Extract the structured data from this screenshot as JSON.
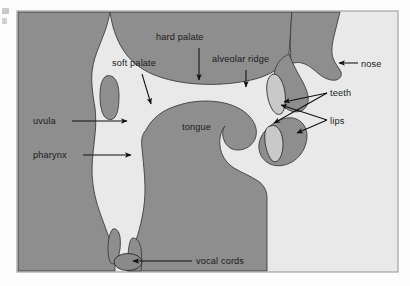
{
  "figure": {
    "kind": "anatomical-diagram",
    "frame": {
      "x": 17,
      "y": 11,
      "width": 381,
      "height": 261
    },
    "colors": {
      "page_background": "#fdfdfd",
      "panel_background": "#e9e9e9",
      "tissue_fill": "#8e8e8e",
      "tissue_outline": "#3d3d3d",
      "teeth_fill": "#c9c9c9",
      "cavity_fill": "#e9e9e9",
      "label_text": "#1a1a1a",
      "leader_line": "#111111",
      "frame_border": "#9a9a9a"
    }
  },
  "labels": [
    {
      "id": "hard-palate",
      "text": "hard palate",
      "x": 156,
      "y": 40,
      "anchor": "start"
    },
    {
      "id": "soft-palate",
      "text": "soft palate",
      "x": 112,
      "y": 66,
      "anchor": "start"
    },
    {
      "id": "alveolar-ridge",
      "text": "alveolar ridge",
      "x": 212,
      "y": 62,
      "anchor": "start"
    },
    {
      "id": "nose",
      "text": "nose",
      "x": 361,
      "y": 67,
      "anchor": "start"
    },
    {
      "id": "teeth",
      "text": "teeth",
      "x": 330,
      "y": 96,
      "anchor": "start"
    },
    {
      "id": "lips",
      "text": "lips",
      "x": 330,
      "y": 124,
      "anchor": "start"
    },
    {
      "id": "uvula",
      "text": "uvula",
      "x": 33,
      "y": 124,
      "anchor": "start"
    },
    {
      "id": "pharynx",
      "text": "pharynx",
      "x": 33,
      "y": 158,
      "anchor": "start"
    },
    {
      "id": "tongue",
      "text": "tongue",
      "x": 182,
      "y": 130,
      "anchor": "start"
    },
    {
      "id": "vocal-cords",
      "text": "vocal cords",
      "x": 196,
      "y": 264,
      "anchor": "start"
    }
  ],
  "margin_bleed": {
    "line1": "of",
    "line2": "f"
  }
}
